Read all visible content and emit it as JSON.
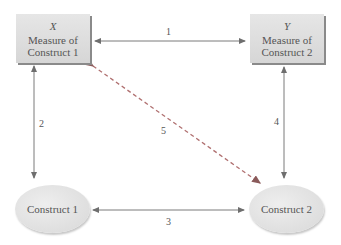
{
  "nodes": {
    "x_box": {
      "var": "X",
      "line1": "Measure of",
      "line2": "Construct 1"
    },
    "y_box": {
      "var": "Y",
      "line1": "Measure of",
      "line2": "Construct 2"
    },
    "construct1": {
      "label": "Construct 1"
    },
    "construct2": {
      "label": "Construct 2"
    }
  },
  "edges": [
    {
      "id": "1",
      "label": "1",
      "from": "x_box",
      "to": "y_box",
      "style": "solid"
    },
    {
      "id": "2",
      "label": "2",
      "from": "x_box",
      "to": "construct1",
      "style": "solid"
    },
    {
      "id": "3",
      "label": "3",
      "from": "construct1",
      "to": "construct2",
      "style": "solid"
    },
    {
      "id": "4",
      "label": "4",
      "from": "y_box",
      "to": "construct2",
      "style": "solid"
    },
    {
      "id": "5",
      "label": "5",
      "from": "x_box",
      "to": "construct2",
      "style": "dashed"
    }
  ],
  "colors": {
    "solid_line": "#7a7a7a",
    "dashed_line": "#b07070"
  }
}
